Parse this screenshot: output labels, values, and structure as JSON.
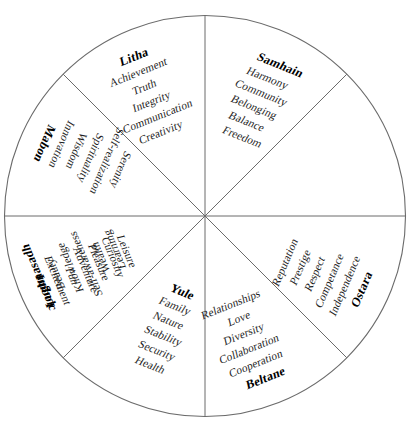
{
  "figure": {
    "kind": "wheel-of-the-year-diagram",
    "shape": "circle divided into eight equal sectors",
    "geometry": {
      "center_x": 205,
      "center_y": 216,
      "radius": 201,
      "sector_count": 8,
      "sector_degrees": 45
    },
    "colors": {
      "background": "#ffffff",
      "outline": "#6b6b6b",
      "spoke": "#6b6b6b",
      "text": "#1e1e1e",
      "label_text": "#000000"
    }
  },
  "sectors": [
    {
      "id": "samhain",
      "label": "Samhain",
      "position": "upper-left-inner",
      "label_placement": "outer",
      "values": [
        "Harmony",
        "Community",
        "Belonging",
        "Balance",
        "Freedom"
      ]
    },
    {
      "id": "yule",
      "label": "Yule",
      "position": "upper-right-inner",
      "label_placement": "outer",
      "values": [
        "Family",
        "Nature",
        "Stability",
        "Security",
        "Health"
      ]
    },
    {
      "id": "imbolc",
      "label": "Imbolc",
      "position": "right-upper",
      "label_placement": "outer",
      "values": [
        "Excitement",
        "Fun",
        "Adventure",
        "Pleasure",
        "Curiosity",
        "Leisure"
      ]
    },
    {
      "id": "ostara",
      "label": "Ostara",
      "position": "right-lower",
      "label_placement": "outer",
      "values": [
        "Independence",
        "Competance",
        "Respect",
        "Prestige",
        "Reputation"
      ]
    },
    {
      "id": "beltane",
      "label": "Beltane",
      "position": "lower-right-inner",
      "label_placement": "outer",
      "values": [
        "Cooperation",
        "Collaboration",
        "Diversity",
        "Love",
        "Relationships"
      ]
    },
    {
      "id": "litha",
      "label": "Litha",
      "position": "lower-left-inner",
      "label_placement": "outer",
      "values": [
        "Achievement",
        "Truth",
        "Integrity",
        "Communication",
        "Creativity"
      ]
    },
    {
      "id": "lughnasadh",
      "label": "Lughnasadh",
      "position": "left-lower",
      "label_placement": "outer",
      "values": [
        "Beauty",
        "Knowledge",
        "Self-awareness",
        "Wealth",
        "Learning"
      ]
    },
    {
      "id": "mabon",
      "label": "Mabon",
      "position": "left-upper",
      "label_placement": "outer",
      "values": [
        "Innovation",
        "Wisdom",
        "Spirituality",
        "Self-realization",
        "Serenity"
      ]
    }
  ]
}
